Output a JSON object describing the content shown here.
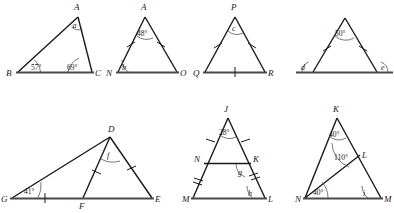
{
  "page": {
    "ink_color": "#1a1a1a",
    "base_color": "#4a4a4a",
    "background": "#ffffff"
  },
  "figures": [
    {
      "id": "fig-1",
      "name": "triangle-abc",
      "vertices": [
        {
          "label": "A",
          "x": 78,
          "y": 12
        },
        {
          "label": "B",
          "x": 18,
          "y": 72
        },
        {
          "label": "C",
          "x": 92,
          "y": 72
        }
      ],
      "angles": [
        {
          "name": "angle-a",
          "label": "a",
          "value": "a",
          "at": "A"
        },
        {
          "name": "angle-b",
          "label": "57°",
          "value": "57",
          "at": "B"
        },
        {
          "name": "angle-c",
          "label": "69°",
          "value": "69",
          "at": "C"
        }
      ],
      "ticks": []
    },
    {
      "id": "fig-2",
      "name": "triangle-ano",
      "vertices": [
        {
          "label": "A",
          "x": 145,
          "y": 12
        },
        {
          "label": "N",
          "x": 118,
          "y": 72
        },
        {
          "label": "O",
          "x": 177,
          "y": 72
        }
      ],
      "angles": [
        {
          "name": "angle-a",
          "label": "48°",
          "value": "48",
          "at": "A"
        },
        {
          "name": "angle-b",
          "label": "b",
          "value": "b",
          "at": "N"
        }
      ],
      "ticks": [
        "AN",
        "AO"
      ]
    },
    {
      "id": "fig-3",
      "name": "triangle-pqr",
      "vertices": [
        {
          "label": "P",
          "x": 235,
          "y": 12
        },
        {
          "label": "Q",
          "x": 205,
          "y": 72
        },
        {
          "label": "R",
          "x": 265,
          "y": 72
        }
      ],
      "angles": [
        {
          "name": "angle-c",
          "label": "c",
          "value": "c",
          "at": "P"
        }
      ],
      "ticks": [
        "PQ",
        "PR",
        "QR"
      ]
    },
    {
      "id": "fig-4",
      "name": "triangle-exterior-angles",
      "vertices": [
        {
          "label": "",
          "x": 345,
          "y": 14
        },
        {
          "label": "",
          "x": 313,
          "y": 72
        },
        {
          "label": "",
          "x": 377,
          "y": 72
        }
      ],
      "angles": [
        {
          "name": "angle-apex",
          "label": "50°",
          "value": "50",
          "at": "apex"
        },
        {
          "name": "angle-d",
          "label": "d",
          "value": "d",
          "at": "left-exterior"
        },
        {
          "name": "angle-e",
          "label": "e",
          "value": "e",
          "at": "right-exterior"
        }
      ],
      "ticks": [
        "left-leg",
        "right-leg"
      ],
      "base_extended": true
    },
    {
      "id": "fig-5",
      "name": "triangle-gde-with-point-f",
      "vertices": [
        {
          "label": "G",
          "x": 10,
          "y": 198
        },
        {
          "label": "D",
          "x": 110,
          "y": 136
        },
        {
          "label": "E",
          "x": 152,
          "y": 198
        },
        {
          "label": "F",
          "x": 83,
          "y": 198
        }
      ],
      "angles": [
        {
          "name": "angle-g",
          "label": "41°",
          "value": "41",
          "at": "G"
        },
        {
          "name": "angle-f",
          "label": "f",
          "value": "f",
          "at": "D"
        }
      ],
      "ticks": [
        "GF",
        "DF",
        "DE"
      ]
    },
    {
      "id": "fig-6",
      "name": "triangle-jml-with-parallel-nk",
      "vertices": [
        {
          "label": "J",
          "x": 228,
          "y": 113
        },
        {
          "label": "M",
          "x": 193,
          "y": 198
        },
        {
          "label": "L",
          "x": 265,
          "y": 198
        },
        {
          "label": "N",
          "x": 204,
          "y": 163
        },
        {
          "label": "K",
          "x": 251,
          "y": 163
        }
      ],
      "angles": [
        {
          "name": "angle-j",
          "label": "28°",
          "value": "28",
          "at": "J"
        },
        {
          "name": "angle-g",
          "label": "g",
          "value": "g",
          "at": "K"
        },
        {
          "name": "angle-h",
          "label": "h",
          "value": "h",
          "at": "L"
        }
      ],
      "ticks": [
        "JN",
        "JK",
        "NM",
        "KL"
      ]
    },
    {
      "id": "fig-7",
      "name": "triangle-knm-with-cevian-nl",
      "vertices": [
        {
          "label": "K",
          "x": 337,
          "y": 113
        },
        {
          "label": "N",
          "x": 305,
          "y": 198
        },
        {
          "label": "M",
          "x": 381,
          "y": 198
        },
        {
          "label": "L",
          "x": 360,
          "y": 155
        }
      ],
      "angles": [
        {
          "name": "angle-k",
          "label": "40°",
          "value": "40",
          "at": "K"
        },
        {
          "name": "angle-l",
          "label": "110°",
          "value": "110",
          "at": "L"
        },
        {
          "name": "angle-n",
          "label": "40°",
          "value": "40",
          "at": "N"
        },
        {
          "name": "angle-i",
          "label": "i",
          "value": "i",
          "at": "M"
        }
      ],
      "ticks": []
    }
  ]
}
